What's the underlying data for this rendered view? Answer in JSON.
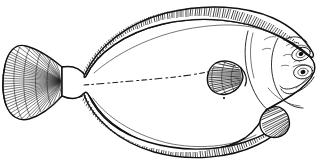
{
  "figure": {
    "title": "Flatfish (flounder) lateral view line illustration",
    "subject": "flatfish",
    "common_name": "Flounder",
    "view": "right-side lateral view, head to the right",
    "style": "black ink line drawing with hatched fin rays",
    "caption": "",
    "background_color": "#ffffff",
    "ink_color": "#101010",
    "width_px": 325,
    "height_px": 163
  },
  "anatomy": {
    "body": {
      "label": "body",
      "shape": "elongate oval / diamond flatfish body",
      "fill_color": "#ffffff",
      "outline_color": "#101010"
    },
    "dorsal_fin": {
      "label": "dorsal fin",
      "position": "top margin, running from behind head to caudal peduncle",
      "ray_count": 86
    },
    "anal_fin": {
      "label": "anal fin",
      "position": "bottom margin, running from pelvic region to caudal peduncle",
      "ray_count": 72
    },
    "caudal_fin": {
      "label": "caudal fin",
      "position": "left end of body, fan shaped",
      "ray_count": 44
    },
    "pectoral_fin": {
      "label": "pectoral fin",
      "position": "mid-right behind gill cover, fan shaped",
      "ray_count": 13
    },
    "pelvic_fin": {
      "label": "pelvic fin",
      "position": "lower right beneath head",
      "ray_count": 11
    },
    "lateral_line": {
      "label": "lateral line",
      "position": "dashed line running from caudal peduncle forward to pectoral region",
      "style": "dashed"
    },
    "head": {
      "label": "head",
      "position": "right end"
    },
    "upper_eye": {
      "label": "upper eye",
      "position": "upper right of head"
    },
    "lower_eye": {
      "label": "lower eye",
      "position": "right of head, below and forward of upper eye"
    },
    "mouth": {
      "label": "mouth",
      "position": "far right, terminal"
    },
    "gill_cover": {
      "label": "gill cover (operculum)",
      "position": "curved line separating head from body"
    },
    "caudal_peduncle": {
      "label": "caudal peduncle",
      "position": "narrow waist joining body to tail fin"
    }
  }
}
